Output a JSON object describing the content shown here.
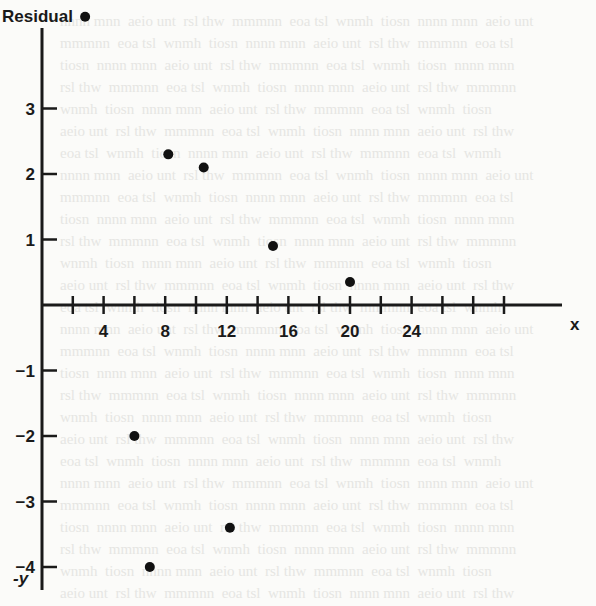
{
  "chart_data": {
    "type": "scatter",
    "title": "",
    "ylabel": "Residual",
    "xlabel": "x",
    "y_neg_label": "-y",
    "xlim": [
      0,
      30
    ],
    "ylim": [
      -4.3,
      4.5
    ],
    "x_ticks": [
      2,
      4,
      6,
      8,
      10,
      12,
      14,
      16,
      18,
      20,
      22,
      24,
      26,
      28,
      30
    ],
    "x_tick_labels": [
      {
        "value": 4,
        "label": "4"
      },
      {
        "value": 8,
        "label": "8"
      },
      {
        "value": 12,
        "label": "12"
      },
      {
        "value": 16,
        "label": "16"
      },
      {
        "value": 20,
        "label": "20"
      },
      {
        "value": 24,
        "label": "24"
      }
    ],
    "y_tick_labels": [
      {
        "value": 3,
        "label": "3"
      },
      {
        "value": 2,
        "label": "2"
      },
      {
        "value": 1,
        "label": "1"
      },
      {
        "value": -1,
        "label": "−1"
      },
      {
        "value": -2,
        "label": "−2"
      },
      {
        "value": -3,
        "label": "−3"
      },
      {
        "value": -4,
        "label": "−4"
      }
    ],
    "grid": false,
    "legend": null,
    "series": [
      {
        "name": "Residuals",
        "points": [
          {
            "x": 2.8,
            "y": 4.4
          },
          {
            "x": 8.2,
            "y": 2.3
          },
          {
            "x": 10.5,
            "y": 2.1
          },
          {
            "x": 15.0,
            "y": 0.9
          },
          {
            "x": 20.0,
            "y": 0.35
          },
          {
            "x": 6.0,
            "y": -2.0
          },
          {
            "x": 12.2,
            "y": -3.4
          },
          {
            "x": 7.0,
            "y": -4.0
          }
        ]
      }
    ]
  },
  "colors": {
    "ink": "#1a1a1a",
    "paper": "#fbfbf9",
    "bleed": "#e6e6e3"
  }
}
